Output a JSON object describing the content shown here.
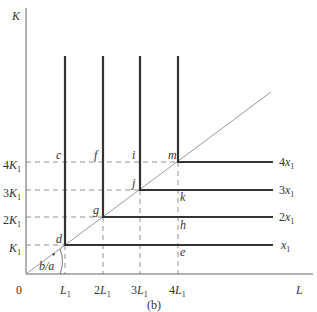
{
  "figure": {
    "caption": "(b)",
    "axes": {
      "x_label": "L",
      "y_label": "K",
      "origin_label": "0"
    },
    "x_ticks": [
      {
        "coef": "",
        "base": "L",
        "sub": "1",
        "x": 65
      },
      {
        "coef": "2",
        "base": "L",
        "sub": "1",
        "x": 103
      },
      {
        "coef": "3",
        "base": "L",
        "sub": "1",
        "x": 140
      },
      {
        "coef": "4",
        "base": "L",
        "sub": "1",
        "x": 178
      }
    ],
    "y_ticks": [
      {
        "coef": "",
        "base": "K",
        "sub": "1",
        "y": 245
      },
      {
        "coef": "2",
        "base": "K",
        "sub": "1",
        "y": 217
      },
      {
        "coef": "3",
        "base": "K",
        "sub": "1",
        "y": 190
      },
      {
        "coef": "4",
        "base": "K",
        "sub": "1",
        "y": 162
      }
    ],
    "isoquants": [
      {
        "label_coef": "",
        "label_base": "x",
        "label_sub": "1",
        "corner_x": 65,
        "corner_y": 245
      },
      {
        "label_coef": "2",
        "label_base": "x",
        "label_sub": "1",
        "corner_x": 103,
        "corner_y": 217
      },
      {
        "label_coef": "3",
        "label_base": "x",
        "label_sub": "1",
        "corner_x": 140,
        "corner_y": 190
      },
      {
        "label_coef": "4",
        "label_base": "x",
        "label_sub": "1",
        "corner_x": 178,
        "corner_y": 162
      }
    ],
    "points": {
      "c": "c",
      "d": "d",
      "e": "e",
      "f": "f",
      "g": "g",
      "h": "h",
      "i": "i",
      "j": "j",
      "k": "k",
      "m": "m"
    },
    "angle_label": "b/a",
    "colors": {
      "isoquant": "#333333",
      "axis": "#555555",
      "ray": "#888888",
      "dash": "#777777"
    }
  }
}
